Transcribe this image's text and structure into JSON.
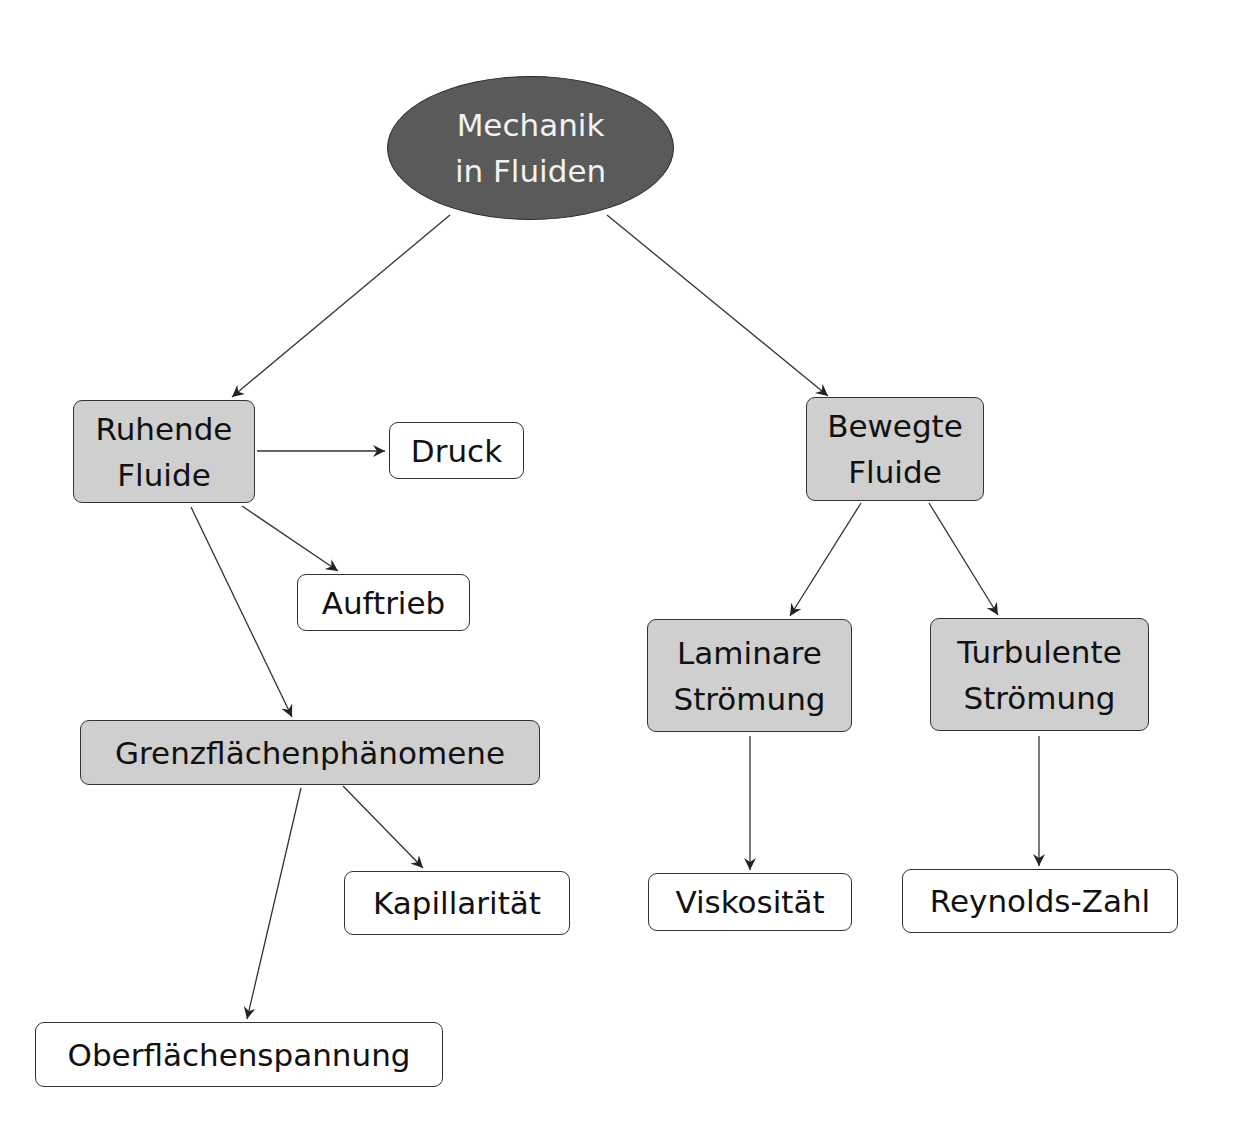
{
  "diagram": {
    "type": "concept-map",
    "root": {
      "label": "Mechanik\nin Fluiden",
      "fill": "#5a5a5a",
      "text_color": "#f2f2f2"
    },
    "category_fill": "#cfcfcf",
    "leaf_fill": "#ffffff",
    "nodes": {
      "ruhende": {
        "label": "Ruhende\nFluide"
      },
      "druck": {
        "label": "Druck"
      },
      "auftrieb": {
        "label": "Auftrieb"
      },
      "grenz": {
        "label": "Grenzflächenphänomene"
      },
      "kapillar": {
        "label": "Kapillarität"
      },
      "oberfl": {
        "label": "Oberflächenspannung"
      },
      "bewegte": {
        "label": "Bewegte\nFluide"
      },
      "laminar": {
        "label": "Laminare\nStrömung"
      },
      "turbulent": {
        "label": "Turbulente\nStrömung"
      },
      "viskos": {
        "label": "Viskosität"
      },
      "reynolds": {
        "label": "Reynolds-Zahl"
      }
    },
    "edges": [
      {
        "from": "Mechanik in Fluiden",
        "to": "Ruhende Fluide"
      },
      {
        "from": "Mechanik in Fluiden",
        "to": "Bewegte Fluide"
      },
      {
        "from": "Ruhende Fluide",
        "to": "Druck"
      },
      {
        "from": "Ruhende Fluide",
        "to": "Auftrieb"
      },
      {
        "from": "Ruhende Fluide",
        "to": "Grenzflächenphänomene"
      },
      {
        "from": "Grenzflächenphänomene",
        "to": "Kapillarität"
      },
      {
        "from": "Grenzflächenphänomene",
        "to": "Oberflächenspannung"
      },
      {
        "from": "Bewegte Fluide",
        "to": "Laminare Strömung"
      },
      {
        "from": "Bewegte Fluide",
        "to": "Turbulente Strömung"
      },
      {
        "from": "Laminare Strömung",
        "to": "Viskosität"
      },
      {
        "from": "Turbulente Strömung",
        "to": "Reynolds-Zahl"
      }
    ]
  }
}
